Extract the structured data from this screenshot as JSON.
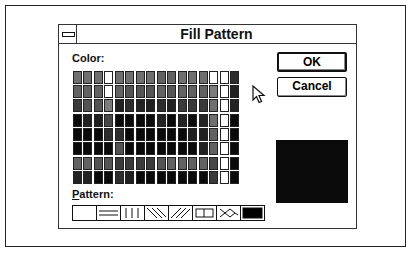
{
  "dialog": {
    "title": "Fill Pattern",
    "color_label": "Color:",
    "pattern_label": "Pattern:",
    "pattern_label_accel": "P",
    "ok_label": "OK",
    "cancel_label": "Cancel",
    "preview_color": "#0a0a0a"
  },
  "color_grid": {
    "columns": 16,
    "rows": [
      [
        2,
        2,
        2,
        0,
        2,
        2,
        2,
        2,
        3,
        3,
        2,
        2,
        2,
        0,
        0,
        7
      ],
      [
        3,
        3,
        3,
        0,
        3,
        4,
        4,
        4,
        3,
        4,
        3,
        3,
        3,
        1,
        0,
        9
      ],
      [
        6,
        4,
        4,
        1,
        8,
        7,
        9,
        8,
        7,
        8,
        6,
        6,
        6,
        2,
        0,
        9
      ],
      [
        10,
        8,
        8,
        5,
        10,
        10,
        10,
        10,
        9,
        10,
        9,
        10,
        9,
        2,
        0,
        10
      ],
      [
        10,
        10,
        10,
        7,
        7,
        10,
        10,
        10,
        10,
        10,
        10,
        8,
        8,
        3,
        0,
        10
      ],
      [
        10,
        10,
        10,
        10,
        4,
        10,
        10,
        10,
        10,
        10,
        10,
        10,
        8,
        3,
        0,
        10
      ],
      [
        3,
        3,
        4,
        4,
        6,
        6,
        6,
        6,
        4,
        3,
        3,
        3,
        3,
        5,
        0,
        10
      ],
      [
        9,
        9,
        10,
        10,
        7,
        8,
        10,
        10,
        10,
        10,
        10,
        10,
        10,
        6,
        0,
        10
      ]
    ]
  },
  "patterns": [
    {
      "name": "none"
    },
    {
      "name": "horizontal"
    },
    {
      "name": "vertical"
    },
    {
      "name": "diagonal-down"
    },
    {
      "name": "diagonal-up"
    },
    {
      "name": "cross"
    },
    {
      "name": "diagonal-cross"
    },
    {
      "name": "solid",
      "selected": true
    }
  ]
}
